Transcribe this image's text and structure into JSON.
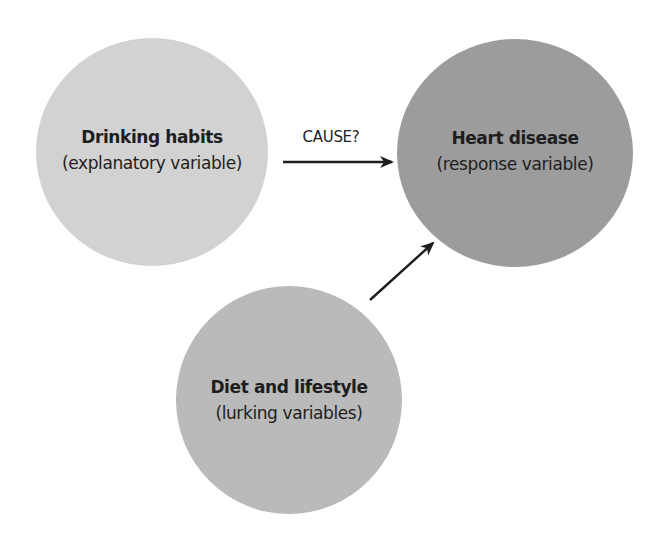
{
  "diagram": {
    "nodes": {
      "explanatory": {
        "title": "Drinking habits",
        "subtitle": "(explanatory variable)",
        "color": "#d2d2d2"
      },
      "response": {
        "title": "Heart disease",
        "subtitle": "(response variable)",
        "color": "#9c9c9c"
      },
      "lurking": {
        "title": "Diet and lifestyle",
        "subtitle": "(lurking variables)",
        "color": "#bababa"
      }
    },
    "edges": [
      {
        "from": "explanatory",
        "to": "response",
        "label": "CAUSE?"
      },
      {
        "from": "lurking",
        "to": "response",
        "label": ""
      }
    ]
  }
}
